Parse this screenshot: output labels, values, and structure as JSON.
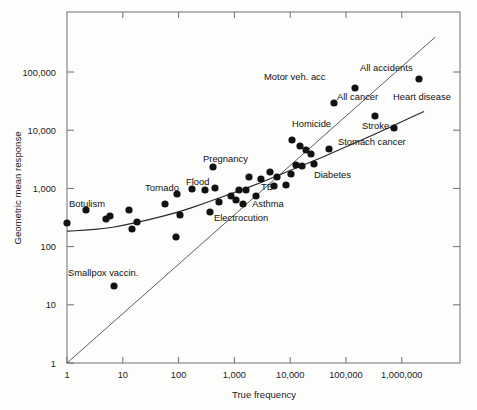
{
  "chart_data": {
    "type": "scatter",
    "title": "",
    "xlabel": "True frequency",
    "ylabel": "Geometric mean response",
    "xscale": "log",
    "yscale": "log",
    "xlim": [
      1,
      4000000
    ],
    "ylim": [
      1,
      400000
    ],
    "grid": false,
    "legend": null,
    "x_tick_labels": [
      "1",
      "10",
      "100",
      "1,000",
      "10,000",
      "100,000",
      "1,000,000"
    ],
    "x_tick_values": [
      1,
      10,
      100,
      1000,
      10000,
      100000,
      1000000
    ],
    "y_tick_labels": [
      "1",
      "10",
      "100",
      "1,000",
      "10,000",
      "100,000"
    ],
    "y_tick_values": [
      1,
      10,
      100,
      1000,
      10000,
      100000
    ],
    "reference_lines": [
      {
        "name": "identity-line",
        "type": "diagonal",
        "description": "y = x",
        "from": [
          1,
          1
        ],
        "to": [
          4000000,
          400000
        ]
      }
    ],
    "fitted_curve": {
      "name": "fitted-curve",
      "description": "best-fit curve of judged frequency vs true frequency",
      "points": [
        [
          1,
          185
        ],
        [
          2,
          190
        ],
        [
          5,
          205
        ],
        [
          10,
          230
        ],
        [
          30,
          290
        ],
        [
          100,
          390
        ],
        [
          300,
          560
        ],
        [
          1000,
          850
        ],
        [
          3000,
          1250
        ],
        [
          10000,
          2050
        ],
        [
          30000,
          3100
        ],
        [
          100000,
          5200
        ],
        [
          300000,
          8200
        ],
        [
          1000000,
          14000
        ],
        [
          2500000,
          21000
        ]
      ]
    },
    "points": [
      {
        "label": "",
        "x": 1,
        "y": 190,
        "px": 67,
        "py": 223
      },
      {
        "label": "Botulism",
        "x": 2.2,
        "y": 330,
        "px": 86,
        "py": 210
      },
      {
        "label": "",
        "x": 5,
        "y": 245,
        "px": 106,
        "py": 219
      },
      {
        "label": "",
        "x": 7,
        "y": 270,
        "px": 110,
        "py": 216
      },
      {
        "label": "",
        "x": 13,
        "y": 330,
        "px": 129,
        "py": 210
      },
      {
        "label": "Smallpox vaccin.",
        "x": 7,
        "y": 21,
        "px": 114,
        "py": 286
      },
      {
        "label": "",
        "x": 17,
        "y": 160,
        "px": 132,
        "py": 229
      },
      {
        "label": "",
        "x": 19,
        "y": 205,
        "px": 137,
        "py": 222
      },
      {
        "label": "",
        "x": 52,
        "y": 430,
        "px": 165,
        "py": 204
      },
      {
        "label": "",
        "x": 100,
        "y": 115,
        "px": 176,
        "py": 237
      },
      {
        "label": "",
        "x": 118,
        "y": 270,
        "px": 180,
        "py": 215
      },
      {
        "label": "Tornado",
        "x": 105,
        "y": 650,
        "px": 177,
        "py": 194
      },
      {
        "label": "Flood",
        "x": 200,
        "y": 820,
        "px": 192,
        "py": 189
      },
      {
        "label": "",
        "x": 330,
        "y": 800,
        "px": 205,
        "py": 190
      },
      {
        "label": "Pregnancy",
        "x": 430,
        "y": 2000,
        "px": 213,
        "py": 167
      },
      {
        "label": "",
        "x": 480,
        "y": 870,
        "px": 215,
        "py": 188
      },
      {
        "label": "",
        "x": 700,
        "y": 470,
        "px": 219,
        "py": 202
      },
      {
        "label": "Electrocution",
        "x": 900,
        "y": 310,
        "px": 210,
        "py": 212
      },
      {
        "label": "",
        "x": 1000,
        "y": 610,
        "px": 231,
        "py": 196
      },
      {
        "label": "",
        "x": 1400,
        "y": 810,
        "px": 239,
        "py": 190
      },
      {
        "label": "",
        "x": 1500,
        "y": 790,
        "px": 246,
        "py": 190
      },
      {
        "label": "",
        "x": 1700,
        "y": 510,
        "px": 236,
        "py": 200
      },
      {
        "label": "Asthma",
        "x": 1900,
        "y": 430,
        "px": 243,
        "py": 204
      },
      {
        "label": "TB",
        "x": 2600,
        "y": 620,
        "px": 256,
        "py": 196
      },
      {
        "label": "",
        "x": 2800,
        "y": 1350,
        "px": 249,
        "py": 177
      },
      {
        "label": "",
        "x": 4200,
        "y": 1250,
        "px": 261,
        "py": 179
      },
      {
        "label": "",
        "x": 5200,
        "y": 1700,
        "px": 270,
        "py": 172
      },
      {
        "label": "",
        "x": 6800,
        "y": 1400,
        "px": 277,
        "py": 177
      },
      {
        "label": "",
        "x": 9000,
        "y": 950,
        "px": 274,
        "py": 186
      },
      {
        "label": "Diabetes",
        "x": 13000,
        "y": 1000,
        "px": 286,
        "py": 185
      },
      {
        "label": "",
        "x": 15000,
        "y": 1600,
        "px": 291,
        "py": 174
      },
      {
        "label": "",
        "x": 17000,
        "y": 2300,
        "px": 296,
        "py": 165
      },
      {
        "label": "",
        "x": 22000,
        "y": 2200,
        "px": 302,
        "py": 166
      },
      {
        "label": "Homicide",
        "x": 19000,
        "y": 6800,
        "px": 292,
        "py": 140
      },
      {
        "label": "",
        "x": 26000,
        "y": 5000,
        "px": 300,
        "py": 146
      },
      {
        "label": "",
        "x": 35000,
        "y": 4100,
        "px": 306,
        "py": 150
      },
      {
        "label": "",
        "x": 45000,
        "y": 3400,
        "px": 311,
        "py": 154
      },
      {
        "label": "Stomach cancer",
        "x": 55000,
        "y": 2400,
        "px": 314,
        "py": 164
      },
      {
        "label": "Stroke",
        "x": 90000,
        "y": 4200,
        "px": 329,
        "py": 149
      },
      {
        "label": "Motor veh. acc",
        "x": 55000,
        "y": 41000,
        "px": 334,
        "py": 103
      },
      {
        "label": "All accidents",
        "x": 110000,
        "y": 60000,
        "px": 355,
        "py": 88
      },
      {
        "label": "All cancer",
        "x": 160000,
        "y": 22000,
        "px": 375,
        "py": 116
      },
      {
        "label": "Heart disease",
        "x": 350000,
        "y": 13000,
        "px": 394,
        "py": 128
      },
      {
        "label": "",
        "x": 1000000,
        "y": 37000,
        "px": 419,
        "py": 79
      }
    ],
    "labels": [
      {
        "text": "Botulism",
        "px": 69,
        "py": 207,
        "anchor": "start"
      },
      {
        "text": "Smallpox vaccin.",
        "px": 68,
        "py": 276,
        "anchor": "start"
      },
      {
        "text": "Tornado",
        "px": 145,
        "py": 191,
        "anchor": "start"
      },
      {
        "text": "Flood",
        "px": 186,
        "py": 185,
        "anchor": "start"
      },
      {
        "text": "Pregnancy",
        "px": 203,
        "py": 162,
        "anchor": "start"
      },
      {
        "text": "Electrocution",
        "px": 214,
        "py": 221,
        "anchor": "start"
      },
      {
        "text": "Asthma",
        "px": 252,
        "py": 207,
        "anchor": "start"
      },
      {
        "text": "TB",
        "px": 261,
        "py": 190,
        "anchor": "start"
      },
      {
        "text": "Diabetes",
        "px": 314,
        "py": 178,
        "anchor": "start"
      },
      {
        "text": "Homicide",
        "px": 292,
        "py": 127,
        "anchor": "start"
      },
      {
        "text": "Stomach cancer",
        "px": 338,
        "py": 145,
        "anchor": "start"
      },
      {
        "text": "Stroke",
        "px": 362,
        "py": 129,
        "anchor": "start"
      },
      {
        "text": "Motor veh. acc",
        "px": 264,
        "py": 80,
        "anchor": "start"
      },
      {
        "text": "All accidents",
        "px": 360,
        "py": 71,
        "anchor": "start"
      },
      {
        "text": "All cancer",
        "px": 337,
        "py": 100,
        "anchor": "start"
      },
      {
        "text": "Heart disease",
        "px": 393,
        "py": 100,
        "anchor": "start"
      }
    ]
  },
  "axes": {
    "x_title": "True frequency",
    "y_title": "Geometric mean response"
  }
}
